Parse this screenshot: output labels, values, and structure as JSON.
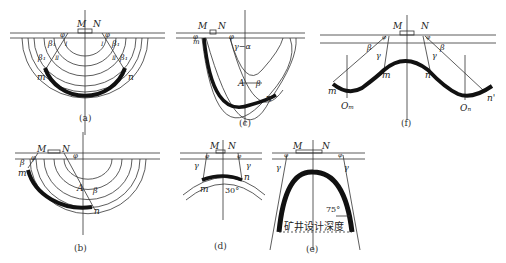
{
  "panels": {
    "a": {
      "caption": "(a)",
      "labels": {
        "M": "M",
        "N": "N",
        "phi": "φ",
        "beta1": "β₁",
        "I": "Ⅰ",
        "II": "Ⅱ",
        "m": "m",
        "n": "n"
      }
    },
    "b": {
      "caption": "(b)",
      "labels": {
        "M": "M",
        "N": "N",
        "phi": "φ",
        "beta": "β",
        "A": "A",
        "m": "m",
        "n": "n"
      }
    },
    "c": {
      "caption": "(c)",
      "labels": {
        "M": "M",
        "N": "N",
        "phi": "φ",
        "gamma_alpha": "γ−α",
        "A": "A",
        "beta": "β",
        "m": "m",
        "n": "n"
      }
    },
    "d": {
      "caption": "(d)",
      "labels": {
        "M": "M",
        "N": "N",
        "phi": "φ",
        "gamma": "γ",
        "m": "m",
        "n": "n",
        "angle": "30°"
      }
    },
    "e": {
      "caption": "(e)",
      "labels": {
        "M": "M",
        "N": "N",
        "phi": "φ",
        "gamma": "γ",
        "angle": "75°",
        "design_depth": "矿井设计深度"
      }
    },
    "f": {
      "caption": "(f)",
      "labels": {
        "M": "M",
        "N": "N",
        "phi": "φ",
        "beta": "β",
        "gamma": "γ",
        "m": "m",
        "n": "n",
        "m_left": "m",
        "n_right": "n'",
        "Om": "Oₘ",
        "On": "Oₙ"
      }
    }
  }
}
